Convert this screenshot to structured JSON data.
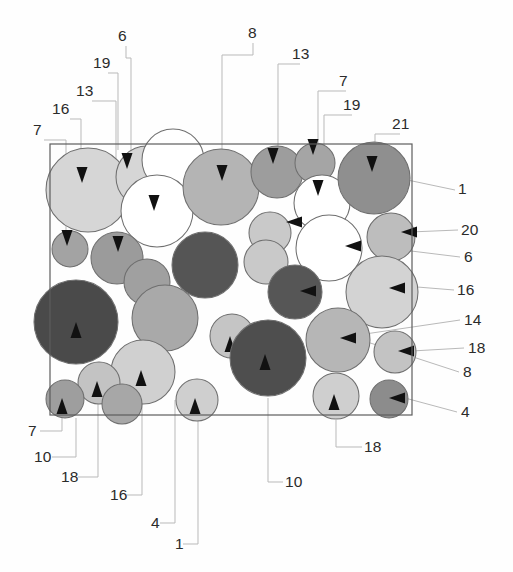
{
  "figure": {
    "frame": {
      "x": 50,
      "y": 144,
      "width": 362,
      "height": 271
    },
    "canvas": {
      "width": 513,
      "height": 572
    },
    "palette": {
      "white": "#ffffff",
      "light": "#dcdcdc",
      "light2": "#d2d2d2",
      "mid_light": "#c6c6c6",
      "mid": "#a8a8a8",
      "mid_dark": "#909090",
      "dark": "#6e6e6e",
      "darkest": "#4a4a4a",
      "outline": "#6f6f6f",
      "frame_stroke": "#5d5d5d",
      "leader_stroke": "#b9b9b9",
      "label_text": "#2b2b2b"
    },
    "particles": [
      {
        "id": "p01",
        "cx": 88,
        "cy": 190,
        "r": 42,
        "shade": "#d6d6d6",
        "arrow": "down",
        "ax": 82,
        "ay": 180
      },
      {
        "id": "p02",
        "cx": 147,
        "cy": 177,
        "r": 31,
        "shade": "#d6d6d6",
        "arrow": "down",
        "ax": 127,
        "ay": 166
      },
      {
        "id": "p03",
        "cx": 173,
        "cy": 160,
        "r": 31,
        "shade": "#ffffff",
        "arrow": "none",
        "ax": 0,
        "ay": 0
      },
      {
        "id": "p04",
        "cx": 157,
        "cy": 211,
        "r": 36,
        "shade": "#ffffff",
        "arrow": "down",
        "ax": 154,
        "ay": 208
      },
      {
        "id": "p05",
        "cx": 221,
        "cy": 187,
        "r": 38,
        "shade": "#b4b4b4",
        "arrow": "down",
        "ax": 222,
        "ay": 178
      },
      {
        "id": "p06",
        "cx": 277,
        "cy": 172,
        "r": 26,
        "shade": "#9d9d9d",
        "arrow": "down",
        "ax": 273,
        "ay": 161
      },
      {
        "id": "p07",
        "cx": 315,
        "cy": 163,
        "r": 20,
        "shade": "#a5a5a5",
        "arrow": "down",
        "ax": 313,
        "ay": 152
      },
      {
        "id": "p08",
        "cx": 322,
        "cy": 203,
        "r": 28,
        "shade": "#ffffff",
        "arrow": "down",
        "ax": 318,
        "ay": 193
      },
      {
        "id": "p09",
        "cx": 374,
        "cy": 178,
        "r": 36,
        "shade": "#8f8f8f",
        "arrow": "down",
        "ax": 372,
        "ay": 169
      },
      {
        "id": "p10",
        "cx": 70,
        "cy": 249,
        "r": 18,
        "shade": "#a3a3a3",
        "arrow": "down",
        "ax": 67,
        "ay": 243
      },
      {
        "id": "p11",
        "cx": 117,
        "cy": 258,
        "r": 26,
        "shade": "#9b9b9b",
        "arrow": "down",
        "ax": 118,
        "ay": 249
      },
      {
        "id": "p12",
        "cx": 147,
        "cy": 282,
        "r": 23,
        "shade": "#a0a0a0",
        "arrow": "none",
        "ax": 0,
        "ay": 0
      },
      {
        "id": "p13",
        "cx": 205,
        "cy": 265,
        "r": 33,
        "shade": "#555555",
        "arrow": "none",
        "ax": 0,
        "ay": 0
      },
      {
        "id": "p14",
        "cx": 270,
        "cy": 233,
        "r": 21,
        "shade": "#c9c9c9",
        "arrow": "left",
        "ax": 289,
        "ay": 222
      },
      {
        "id": "p15",
        "cx": 266,
        "cy": 262,
        "r": 22,
        "shade": "#c9c9c9",
        "arrow": "none",
        "ax": 0,
        "ay": 0
      },
      {
        "id": "p16",
        "cx": 329,
        "cy": 248,
        "r": 33,
        "shade": "#ffffff",
        "arrow": "left",
        "ax": 348,
        "ay": 246
      },
      {
        "id": "p17",
        "cx": 391,
        "cy": 237,
        "r": 24,
        "shade": "#bdbdbd",
        "arrow": "left",
        "ax": 404,
        "ay": 232
      },
      {
        "id": "p18",
        "cx": 295,
        "cy": 292,
        "r": 27,
        "shade": "#565656",
        "arrow": "left",
        "ax": 303,
        "ay": 291
      },
      {
        "id": "p19",
        "cx": 382,
        "cy": 292,
        "r": 36,
        "shade": "#d3d3d3",
        "arrow": "left",
        "ax": 392,
        "ay": 288
      },
      {
        "id": "p20",
        "cx": 76,
        "cy": 322,
        "r": 42,
        "shade": "#4a4a4a",
        "arrow": "up",
        "ax": 76,
        "ay": 325
      },
      {
        "id": "p21",
        "cx": 165,
        "cy": 318,
        "r": 33,
        "shade": "#a9a9a9",
        "arrow": "none",
        "ax": 0,
        "ay": 0
      },
      {
        "id": "p22",
        "cx": 232,
        "cy": 336,
        "r": 22,
        "shade": "#c5c5c5",
        "arrow": "up",
        "ax": 230,
        "ay": 339
      },
      {
        "id": "p23",
        "cx": 268,
        "cy": 358,
        "r": 38,
        "shade": "#4e4e4e",
        "arrow": "up",
        "ax": 265,
        "ay": 357
      },
      {
        "id": "p24",
        "cx": 338,
        "cy": 340,
        "r": 32,
        "shade": "#b6b6b6",
        "arrow": "left",
        "ax": 343,
        "ay": 338
      },
      {
        "id": "p25",
        "cx": 395,
        "cy": 352,
        "r": 21,
        "shade": "#c3c3c3",
        "arrow": "left",
        "ax": 401,
        "ay": 351
      },
      {
        "id": "p26",
        "cx": 143,
        "cy": 372,
        "r": 32,
        "shade": "#d0d0d0",
        "arrow": "up",
        "ax": 141,
        "ay": 373
      },
      {
        "id": "p27",
        "cx": 99,
        "cy": 383,
        "r": 21,
        "shade": "#c3c3c3",
        "arrow": "up",
        "ax": 97,
        "ay": 384
      },
      {
        "id": "p28",
        "cx": 65,
        "cy": 399,
        "r": 19,
        "shade": "#9e9e9e",
        "arrow": "up",
        "ax": 62,
        "ay": 401
      },
      {
        "id": "p29",
        "cx": 122,
        "cy": 404,
        "r": 20,
        "shade": "#a7a7a7",
        "arrow": "none",
        "ax": 0,
        "ay": 0
      },
      {
        "id": "p30",
        "cx": 197,
        "cy": 400,
        "r": 21,
        "shade": "#cfcfcf",
        "arrow": "up",
        "ax": 195,
        "ay": 401
      },
      {
        "id": "p31",
        "cx": 336,
        "cy": 396,
        "r": 23,
        "shade": "#cfcfcf",
        "arrow": "up",
        "ax": 334,
        "ay": 397
      },
      {
        "id": "p32",
        "cx": 389,
        "cy": 399,
        "r": 19,
        "shade": "#8c8c8c",
        "arrow": "left",
        "ax": 392,
        "ay": 398
      }
    ],
    "labels_top": [
      {
        "text": "6",
        "x": 118,
        "y": 41,
        "leader": "M126,46 L126,58 L131,58 L131,160"
      },
      {
        "text": "19",
        "x": 93,
        "y": 68,
        "leader": "M108,73 L118,73 L118,150"
      },
      {
        "text": "13",
        "x": 76,
        "y": 96,
        "leader": "M92,101 L116,101 L116,168"
      },
      {
        "text": "16",
        "x": 52,
        "y": 114,
        "leader": "M70,119 L81,119 L81,183"
      },
      {
        "text": "7",
        "x": 33,
        "y": 135,
        "leader": "M44,140 L66,140 L66,255"
      },
      {
        "text": "8",
        "x": 248,
        "y": 38,
        "leader": "M253,43 L253,55 L222,55 L222,176"
      },
      {
        "text": "13",
        "x": 292,
        "y": 59,
        "leader": "M300,64 L278,64 L278,160"
      },
      {
        "text": "7",
        "x": 339,
        "y": 86,
        "leader": "M346,91 L318,91 L318,152"
      },
      {
        "text": "19",
        "x": 343,
        "y": 110,
        "leader": "M352,115 L324,115 L324,196"
      },
      {
        "text": "21",
        "x": 392,
        "y": 129,
        "leader": "M400,134 L375,134 L375,170"
      }
    ],
    "labels_right": [
      {
        "text": "1",
        "x": 458,
        "y": 194,
        "leader": "M455,190 L398,178"
      },
      {
        "text": "20",
        "x": 461,
        "y": 235,
        "leader": "M458,230 L410,232"
      },
      {
        "text": "6",
        "x": 464,
        "y": 262,
        "leader": "M460,257 L403,250"
      },
      {
        "text": "16",
        "x": 457,
        "y": 295,
        "leader": "M454,290 L405,286"
      },
      {
        "text": "14",
        "x": 464,
        "y": 325,
        "leader": "M460,320 L338,338"
      },
      {
        "text": "18",
        "x": 468,
        "y": 353,
        "leader": "M464,348 L412,351"
      },
      {
        "text": "8",
        "x": 463,
        "y": 377,
        "leader": "M459,372 L352,337"
      },
      {
        "text": "4",
        "x": 461,
        "y": 417,
        "leader": "M457,412 L405,398"
      }
    ],
    "labels_bottom": [
      {
        "text": "7",
        "x": 28,
        "y": 436,
        "leader": "M40,431 L62,431 L62,412"
      },
      {
        "text": "10",
        "x": 34,
        "y": 462,
        "leader": "M52,457 L76,457 L76,418"
      },
      {
        "text": "18",
        "x": 61,
        "y": 482,
        "leader": "M78,477 L98,477 L98,404"
      },
      {
        "text": "16",
        "x": 110,
        "y": 500,
        "leader": "M127,495 L142,495 L142,372"
      },
      {
        "text": "4",
        "x": 151,
        "y": 528,
        "leader": "M160,523 L175,523 L175,400"
      },
      {
        "text": "1",
        "x": 175,
        "y": 549,
        "leader": "M183,544 L198,544 L198,400"
      },
      {
        "text": "10",
        "x": 285,
        "y": 487,
        "leader": "M283,482 L268,482 L268,398"
      },
      {
        "text": "18",
        "x": 364,
        "y": 452,
        "leader": "M362,447 L336,447 L336,420"
      }
    ]
  }
}
